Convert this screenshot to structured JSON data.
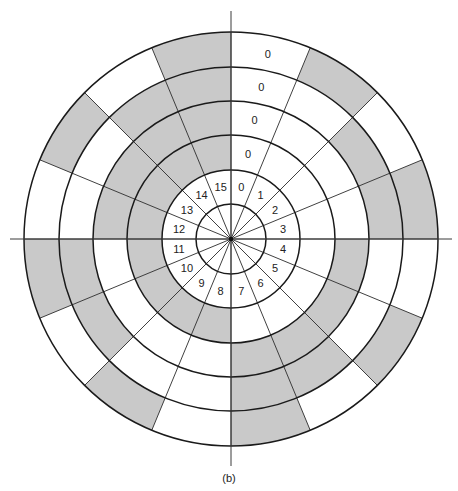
{
  "figure": {
    "caption": "(b)",
    "type": "binary shaft-encoder disc",
    "sector_count": 16,
    "sector_labels": [
      "0",
      "1",
      "2",
      "3",
      "4",
      "5",
      "6",
      "7",
      "8",
      "9",
      "10",
      "11",
      "12",
      "13",
      "14",
      "15"
    ],
    "ring_bit_labels_sector0": [
      "0",
      "0",
      "0",
      "0"
    ],
    "codes": [
      "0000",
      "0001",
      "0010",
      "0011",
      "0100",
      "0101",
      "0110",
      "0111",
      "1000",
      "1001",
      "1010",
      "1011",
      "1100",
      "1101",
      "1110",
      "1111"
    ],
    "ring_order_inner_to_outer": [
      "bit3",
      "bit2",
      "bit1",
      "bit0"
    ],
    "colors": {
      "shaded": "#c9c9c9",
      "unshaded": "#ffffff",
      "line": "#1a1a1a"
    }
  }
}
